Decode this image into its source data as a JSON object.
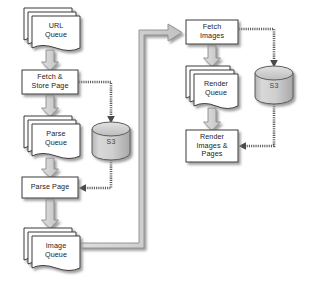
{
  "diagram": {
    "colors": {
      "node_fill": "#ffffff",
      "node_stroke": "#333333",
      "store_fill": "#c8c8c8",
      "store_stroke": "#555555",
      "flow_arrow_fill": "#d0d0d0",
      "flow_arrow_stroke": "#8a8a8a",
      "link_arrow_stroke": "#555555",
      "shadow": "#9a9a9a",
      "background": "#ffffff",
      "text": "#222222"
    },
    "nodes": [
      {
        "id": "url-queue",
        "name": "URL Queue",
        "label": "URL\nQueue",
        "shape": "stacked-document",
        "x": 24,
        "y": 8,
        "w": 56,
        "h": 40
      },
      {
        "id": "fetch-store-page",
        "name": "Fetch & Store Page",
        "label": "Fetch &\nStore Page",
        "shape": "process-box",
        "x": 22,
        "y": 70,
        "w": 56,
        "h": 24
      },
      {
        "id": "parse-queue",
        "name": "Parse Queue",
        "label": "Parse\nQueue",
        "shape": "stacked-document",
        "x": 24,
        "y": 116,
        "w": 56,
        "h": 40
      },
      {
        "id": "parse-page",
        "name": "Parse Page",
        "label": "Parse Page",
        "shape": "process-box",
        "x": 22,
        "y": 177,
        "w": 56,
        "h": 21
      },
      {
        "id": "image-queue",
        "name": "Image Queue",
        "label": "Image\nQueue",
        "shape": "stacked-document",
        "x": 24,
        "y": 228,
        "w": 56,
        "h": 40
      },
      {
        "id": "fetch-images",
        "name": "Fetch Images",
        "label": "Fetch\nImages",
        "shape": "process-box",
        "x": 186,
        "y": 20,
        "w": 52,
        "h": 24
      },
      {
        "id": "render-queue",
        "name": "Render Queue",
        "label": "Render\nQueue",
        "shape": "stacked-document",
        "x": 186,
        "y": 66,
        "w": 52,
        "h": 40
      },
      {
        "id": "render-images-pages",
        "name": "Render Images & Pages",
        "label": "Render\nImages &\nPages",
        "shape": "process-box",
        "x": 186,
        "y": 130,
        "w": 52,
        "h": 32
      },
      {
        "id": "s3-left",
        "name": "S3 bucket (pages)",
        "label": "S3",
        "shape": "cylinder",
        "x": 92,
        "y": 122,
        "w": 38,
        "h": 38
      },
      {
        "id": "s3-right",
        "name": "S3 bucket (images)",
        "label": "S3",
        "shape": "cylinder",
        "x": 255,
        "y": 66,
        "w": 38,
        "h": 38
      }
    ],
    "edges": [
      {
        "id": "e1",
        "name": "url-queue-to-fetch-store-page",
        "from": "url-queue",
        "to": "fetch-store-page",
        "style": "block-arrow"
      },
      {
        "id": "e2",
        "name": "fetch-store-page-to-parse-queue",
        "from": "fetch-store-page",
        "to": "parse-queue",
        "style": "block-arrow"
      },
      {
        "id": "e3",
        "name": "parse-queue-to-parse-page",
        "from": "parse-queue",
        "to": "parse-page",
        "style": "block-arrow"
      },
      {
        "id": "e4",
        "name": "parse-page-to-image-queue",
        "from": "parse-page",
        "to": "image-queue",
        "style": "block-arrow"
      },
      {
        "id": "e5",
        "name": "fetch-store-page-to-s3-left",
        "from": "fetch-store-page",
        "to": "s3-left",
        "style": "hatched-line"
      },
      {
        "id": "e6",
        "name": "s3-left-to-parse-page",
        "from": "s3-left",
        "to": "parse-page",
        "style": "hatched-line"
      },
      {
        "id": "e7",
        "name": "image-queue-to-fetch-images",
        "from": "image-queue",
        "to": "fetch-images",
        "style": "block-arrow"
      },
      {
        "id": "e8",
        "name": "fetch-images-to-render-queue",
        "from": "fetch-images",
        "to": "render-queue",
        "style": "block-arrow"
      },
      {
        "id": "e9",
        "name": "render-queue-to-render-images",
        "from": "render-queue",
        "to": "render-images-pages",
        "style": "block-arrow"
      },
      {
        "id": "e10",
        "name": "fetch-images-to-s3-right",
        "from": "fetch-images",
        "to": "s3-right",
        "style": "hatched-line"
      },
      {
        "id": "e11",
        "name": "s3-right-to-render-images",
        "from": "s3-right",
        "to": "render-images-pages",
        "style": "hatched-line"
      }
    ]
  }
}
